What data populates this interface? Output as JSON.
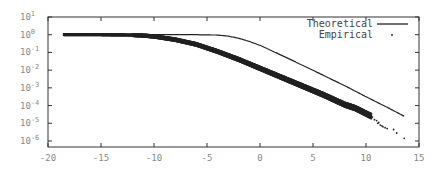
{
  "chart_data": {
    "type": "line",
    "title": "",
    "xlabel": "",
    "ylabel": "",
    "xlim": [
      -20,
      15
    ],
    "ylim_log10": [
      -6,
      1
    ],
    "yscale": "log",
    "grid": false,
    "legend_position": "top-right",
    "x_ticks": [
      "-20",
      "-15",
      "-10",
      "-5",
      "0",
      "5",
      "10",
      "15"
    ],
    "y_ticks": [
      {
        "base": "10",
        "exp": "1"
      },
      {
        "base": "10",
        "exp": "0"
      },
      {
        "base": "10",
        "exp": "-1"
      },
      {
        "base": "10",
        "exp": "-2"
      },
      {
        "base": "10",
        "exp": "-3"
      },
      {
        "base": "10",
        "exp": "-4"
      },
      {
        "base": "10",
        "exp": "-5"
      },
      {
        "base": "10",
        "exp": "-6"
      }
    ],
    "series": [
      {
        "name": "Theoretical",
        "style": "line",
        "x": [
          -18.5,
          -10,
          -6,
          -4,
          -3,
          -2,
          -1,
          0,
          2,
          4,
          6,
          8,
          10,
          12,
          13.6
        ],
        "log10_y": [
          0,
          0,
          0,
          -0.02,
          -0.08,
          -0.2,
          -0.38,
          -0.6,
          -1.15,
          -1.72,
          -2.3,
          -2.88,
          -3.5,
          -4.1,
          -4.6
        ]
      },
      {
        "name": "Empirical",
        "style": "points",
        "x": [
          -18.5,
          -15,
          -12,
          -11,
          -10,
          -8,
          -6,
          -4,
          -2,
          0,
          2,
          4,
          6,
          8,
          9,
          10,
          10.5,
          11,
          11.5,
          12,
          12.5,
          13,
          13.6
        ],
        "log10_y": [
          0,
          0,
          -0.02,
          -0.05,
          -0.1,
          -0.28,
          -0.55,
          -0.95,
          -1.4,
          -1.9,
          -2.4,
          -2.9,
          -3.4,
          -3.95,
          -4.15,
          -4.45,
          -4.6,
          -4.9,
          -5.1,
          -5.25,
          -5.3,
          -5.5,
          -5.85
        ]
      }
    ]
  },
  "legend": {
    "items": [
      {
        "label": "Theoretical",
        "marker": "line"
      },
      {
        "label": "Empirical",
        "marker": "dot"
      }
    ]
  }
}
